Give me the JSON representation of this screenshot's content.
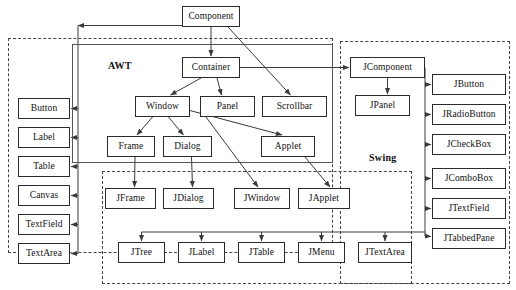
{
  "diagram": {
    "type": "class-hierarchy-diagram",
    "groups": [
      {
        "id": "awt",
        "label": "AWT",
        "label_x": 108,
        "label_y": 60,
        "region": {
          "x": 8,
          "y": 38,
          "w": 325,
          "h": 215
        },
        "style": "dashed"
      },
      {
        "id": "swing",
        "label": "Swing",
        "label_x": 369,
        "label_y": 152,
        "region": {
          "x": 340,
          "y": 41,
          "w": 170,
          "h": 243
        },
        "style": "dashed"
      },
      {
        "id": "swing-lower",
        "label": "",
        "label_x": 0,
        "label_y": 0,
        "region": {
          "x": 102,
          "y": 171,
          "w": 310,
          "h": 113
        },
        "style": "dashed"
      },
      {
        "id": "awt-inner",
        "label": "",
        "label_x": 0,
        "label_y": 0,
        "region": {
          "x": 72,
          "y": 44,
          "w": 261,
          "h": 119
        },
        "style": "solid"
      }
    ],
    "nodes": [
      {
        "id": "component",
        "label": "Component",
        "x": 182,
        "y": 6,
        "w": 58,
        "h": 21
      },
      {
        "id": "container",
        "label": "Container",
        "x": 182,
        "y": 57,
        "w": 58,
        "h": 21
      },
      {
        "id": "window",
        "label": "Window",
        "x": 135,
        "y": 96,
        "w": 55,
        "h": 21
      },
      {
        "id": "panel",
        "label": "Panel",
        "x": 200,
        "y": 96,
        "w": 55,
        "h": 21
      },
      {
        "id": "scrollbar",
        "label": "Scrollbar",
        "x": 262,
        "y": 96,
        "w": 65,
        "h": 21
      },
      {
        "id": "frame",
        "label": "Frame",
        "x": 107,
        "y": 136,
        "w": 48,
        "h": 21
      },
      {
        "id": "dialog",
        "label": "Dialog",
        "x": 163,
        "y": 136,
        "w": 49,
        "h": 21
      },
      {
        "id": "applet",
        "label": "Applet",
        "x": 261,
        "y": 136,
        "w": 54,
        "h": 21
      },
      {
        "id": "button",
        "label": "Button",
        "x": 18,
        "y": 98,
        "w": 52,
        "h": 21
      },
      {
        "id": "label",
        "label": "Label",
        "x": 18,
        "y": 127,
        "w": 52,
        "h": 21
      },
      {
        "id": "table",
        "label": "Table",
        "x": 18,
        "y": 156,
        "w": 52,
        "h": 21
      },
      {
        "id": "canvas",
        "label": "Canvas",
        "x": 18,
        "y": 185,
        "w": 52,
        "h": 21
      },
      {
        "id": "textfield",
        "label": "TextField",
        "x": 18,
        "y": 214,
        "w": 52,
        "h": 21
      },
      {
        "id": "textarea",
        "label": "TextArea",
        "x": 18,
        "y": 243,
        "w": 52,
        "h": 21
      },
      {
        "id": "jcomponent",
        "label": "JComponent",
        "x": 350,
        "y": 57,
        "w": 75,
        "h": 21
      },
      {
        "id": "jpanel",
        "label": "JPanel",
        "x": 355,
        "y": 95,
        "w": 55,
        "h": 21
      },
      {
        "id": "jbutton",
        "label": "JButton",
        "x": 432,
        "y": 74,
        "w": 74,
        "h": 21
      },
      {
        "id": "jradiobutton",
        "label": "JRadioButton",
        "x": 432,
        "y": 104,
        "w": 74,
        "h": 21
      },
      {
        "id": "jcheckbox",
        "label": "JCheckBox",
        "x": 432,
        "y": 134,
        "w": 74,
        "h": 21
      },
      {
        "id": "jcombobox",
        "label": "JComboBox",
        "x": 432,
        "y": 168,
        "w": 74,
        "h": 21
      },
      {
        "id": "jtextfield",
        "label": "JTextField",
        "x": 432,
        "y": 198,
        "w": 74,
        "h": 21
      },
      {
        "id": "jtabbedpane",
        "label": "JTabbedPane",
        "x": 432,
        "y": 228,
        "w": 74,
        "h": 21
      },
      {
        "id": "jframe",
        "label": "JFrame",
        "x": 105,
        "y": 188,
        "w": 51,
        "h": 21
      },
      {
        "id": "jdialog",
        "label": "JDialog",
        "x": 163,
        "y": 188,
        "w": 51,
        "h": 21
      },
      {
        "id": "jwindow",
        "label": "JWindow",
        "x": 234,
        "y": 188,
        "w": 56,
        "h": 21
      },
      {
        "id": "japplet",
        "label": "JApplet",
        "x": 298,
        "y": 188,
        "w": 52,
        "h": 21
      },
      {
        "id": "jtree",
        "label": "JTree",
        "x": 118,
        "y": 242,
        "w": 47,
        "h": 21
      },
      {
        "id": "jlabel",
        "label": "JLabel",
        "x": 178,
        "y": 242,
        "w": 47,
        "h": 21
      },
      {
        "id": "jtable",
        "label": "JTable",
        "x": 238,
        "y": 242,
        "w": 47,
        "h": 21
      },
      {
        "id": "jmenu",
        "label": "JMenu",
        "x": 298,
        "y": 242,
        "w": 47,
        "h": 21
      },
      {
        "id": "jtextarea",
        "label": "JTextArea",
        "x": 358,
        "y": 242,
        "w": 54,
        "h": 21
      }
    ],
    "edges": [
      {
        "from": "component",
        "to": "container",
        "kind": "arrow"
      },
      {
        "from": "component",
        "to": "scrollbar",
        "kind": "arrow"
      },
      {
        "from": "container",
        "to": "window",
        "kind": "arrow"
      },
      {
        "from": "container",
        "to": "panel",
        "kind": "arrow"
      },
      {
        "from": "container",
        "to": "jcomponent",
        "kind": "arrow"
      },
      {
        "from": "window",
        "to": "frame",
        "kind": "arrow"
      },
      {
        "from": "window",
        "to": "dialog",
        "kind": "arrow"
      },
      {
        "from": "window",
        "to": "applet",
        "kind": "arrow"
      },
      {
        "from": "panel",
        "to": "jwindow",
        "kind": "arrow"
      },
      {
        "from": "applet",
        "to": "japplet",
        "kind": "arrow"
      },
      {
        "from": "component",
        "to": "button",
        "kind": "arrow"
      },
      {
        "from": "component",
        "to": "label",
        "kind": "arrow"
      },
      {
        "from": "component",
        "to": "table",
        "kind": "arrow"
      },
      {
        "from": "component",
        "to": "canvas",
        "kind": "arrow"
      },
      {
        "from": "component",
        "to": "textfield",
        "kind": "arrow"
      },
      {
        "from": "component",
        "to": "textarea",
        "kind": "arrow"
      },
      {
        "from": "jcomponent",
        "to": "jpanel",
        "kind": "arrow"
      },
      {
        "from": "jcomponent",
        "to": "jbutton",
        "kind": "arrow"
      },
      {
        "from": "jcomponent",
        "to": "jradiobutton",
        "kind": "arrow"
      },
      {
        "from": "jcomponent",
        "to": "jcheckbox",
        "kind": "arrow"
      },
      {
        "from": "jcomponent",
        "to": "jcombobox",
        "kind": "arrow"
      },
      {
        "from": "jcomponent",
        "to": "jtextfield",
        "kind": "arrow"
      },
      {
        "from": "jcomponent",
        "to": "jtabbedpane",
        "kind": "arrow"
      },
      {
        "from": "frame",
        "to": "jframe",
        "kind": "arrow"
      },
      {
        "from": "dialog",
        "to": "jdialog",
        "kind": "arrow"
      },
      {
        "from": "jcomponent",
        "to": "jtree",
        "kind": "arrow"
      },
      {
        "from": "jcomponent",
        "to": "jlabel",
        "kind": "arrow"
      },
      {
        "from": "jcomponent",
        "to": "jtable",
        "kind": "arrow"
      },
      {
        "from": "jcomponent",
        "to": "jmenu",
        "kind": "arrow"
      },
      {
        "from": "jcomponent",
        "to": "jtextarea",
        "kind": "arrow"
      }
    ],
    "colors": {
      "node_border": "#2b2b2b",
      "node_fill": "#ffffff",
      "line": "#3a3a3a",
      "dashed_region": "#444444",
      "background": "#ffffff",
      "text": "#111111"
    }
  }
}
